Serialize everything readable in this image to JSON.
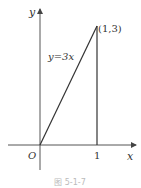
{
  "figure": {
    "axes": {
      "x_label": "x",
      "y_label": "y",
      "origin_label": "O",
      "x_tick_label": "1"
    },
    "line": {
      "equation_label": "y=3x"
    },
    "point": {
      "label": "(1,3)"
    },
    "caption": "图 5-1-7"
  }
}
